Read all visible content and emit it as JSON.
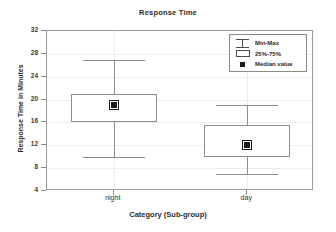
{
  "chart_data": {
    "type": "box",
    "title": "Response Time",
    "xlabel": "Category (Sub-group)",
    "ylabel": "Response Time in Minutes",
    "categories": [
      "night",
      "day"
    ],
    "yticks": [
      32,
      28,
      24,
      20,
      16,
      12,
      8,
      4
    ],
    "ylim": [
      4,
      32
    ],
    "grid": true,
    "legend_position": "top-right",
    "legend": [
      {
        "key": "whisker-glyph",
        "label": "Min-Max"
      },
      {
        "key": "box-glyph",
        "label": "25%-75%"
      },
      {
        "key": "square-marker-glyph",
        "label": "Median value"
      }
    ],
    "boxes": [
      {
        "category": "night",
        "min": 27.0,
        "q3": 21.0,
        "median": 19.0,
        "q1": 16.0,
        "max": 10.0,
        "whisker_high": 27.0,
        "whisker_low": 10.0
      },
      {
        "category": "day",
        "whisker_high": 19.0,
        "q3": 15.5,
        "median": 12.0,
        "q1": 10.0,
        "whisker_low": 7.0
      }
    ],
    "colors": {
      "frame": "#9a9a9a",
      "grid": "#ededed",
      "box_edge": "#8c8c8c",
      "whisker": "#8c8c8c",
      "median_marker": "#1a1a1a",
      "text": "#2b2b2b",
      "background": "#ffffff"
    }
  }
}
